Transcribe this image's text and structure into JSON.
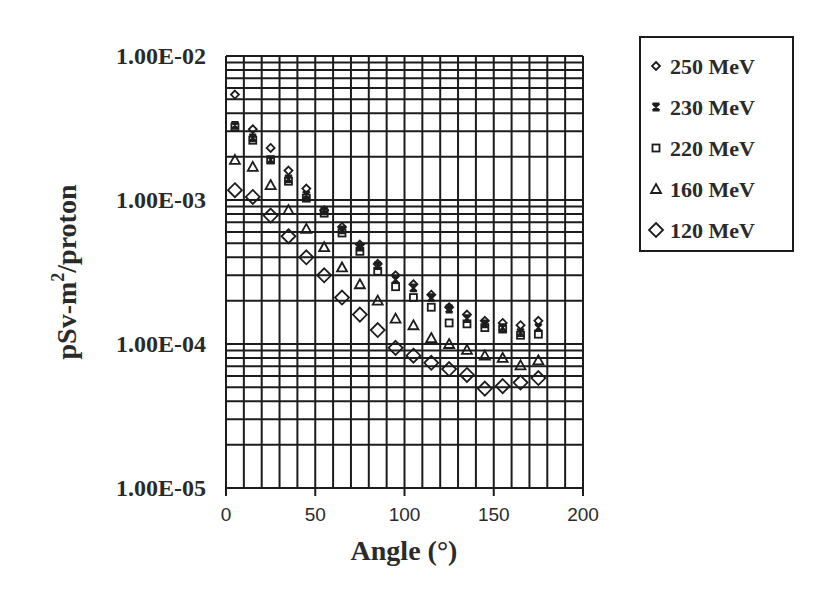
{
  "chart_data": {
    "type": "scatter",
    "title": "",
    "xlabel": "Angle (°)",
    "ylabel": "pSv-m²/proton",
    "ylabel_parts": {
      "base": "pSv-m",
      "sup": "2",
      "rest": "/proton"
    },
    "xlim": [
      0,
      200
    ],
    "ylim": [
      1e-05,
      0.01
    ],
    "yscale": "log",
    "grid": true,
    "legend_position": "top-right",
    "x_ticks": [
      "0",
      "50",
      "100",
      "150",
      "200"
    ],
    "x_tick_values": [
      0,
      50,
      100,
      150,
      200
    ],
    "y_ticks": [
      "1.00E-02",
      "1.00E-03",
      "1.00E-04",
      "1.00E-05"
    ],
    "y_tick_values": [
      0.01,
      0.001,
      0.0001,
      1e-05
    ],
    "x": [
      5,
      15,
      25,
      35,
      45,
      55,
      65,
      75,
      85,
      95,
      105,
      115,
      125,
      135,
      145,
      155,
      165,
      175
    ],
    "series": [
      {
        "name": "250 MeV",
        "marker": "small-diamond",
        "values": [
          0.0054,
          0.0031,
          0.0023,
          0.0016,
          0.0012,
          0.00085,
          0.00065,
          0.00049,
          0.00036,
          0.0003,
          0.00026,
          0.00022,
          0.00018,
          0.00016,
          0.000145,
          0.00014,
          0.000135,
          0.000145
        ]
      },
      {
        "name": "230 MeV",
        "marker": "star",
        "values": [
          0.0033,
          0.0027,
          0.0019,
          0.0014,
          0.00108,
          0.00084,
          0.00062,
          0.00047,
          0.00035,
          0.00028,
          0.000245,
          0.00021,
          0.000175,
          0.00015,
          0.000138,
          0.00013,
          0.00012,
          0.00013
        ]
      },
      {
        "name": "220 MeV",
        "marker": "square",
        "values": [
          0.0032,
          0.0026,
          0.0019,
          0.00135,
          0.00103,
          0.00081,
          0.00059,
          0.00044,
          0.00032,
          0.00025,
          0.00021,
          0.00018,
          0.00014,
          0.000138,
          0.00013,
          0.000127,
          0.000115,
          0.000117
        ]
      },
      {
        "name": "160 MeV",
        "marker": "triangle",
        "values": [
          0.0019,
          0.0017,
          0.00127,
          0.00085,
          0.00063,
          0.00047,
          0.00034,
          0.00026,
          0.0002,
          0.00015,
          0.000135,
          0.00011,
          0.0001,
          9.1e-05,
          8.3e-05,
          8e-05,
          7.1e-05,
          7.7e-05
        ]
      },
      {
        "name": "120 MeV",
        "marker": "large-diamond",
        "values": [
          0.00117,
          0.00105,
          0.00078,
          0.00056,
          0.0004,
          0.0003,
          0.00021,
          0.00016,
          0.000125,
          9.4e-05,
          8.3e-05,
          7.4e-05,
          6.7e-05,
          6.1e-05,
          4.9e-05,
          5.1e-05,
          5.4e-05,
          5.8e-05
        ]
      }
    ]
  }
}
